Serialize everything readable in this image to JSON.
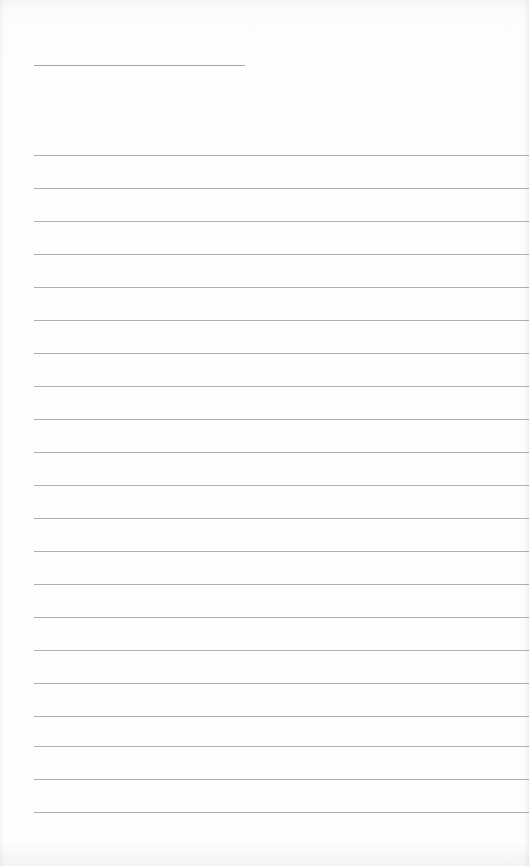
{
  "page": {
    "type": "lined-notebook-page",
    "background_color": "#fdfdfd",
    "line_color": "#8f8f8f"
  },
  "header": {
    "title_text": ""
  },
  "lines": [
    {
      "top": 155,
      "text": ""
    },
    {
      "top": 188,
      "text": ""
    },
    {
      "top": 221,
      "text": ""
    },
    {
      "top": 254,
      "text": ""
    },
    {
      "top": 287,
      "text": ""
    },
    {
      "top": 320,
      "text": ""
    },
    {
      "top": 353,
      "text": ""
    },
    {
      "top": 386,
      "text": ""
    },
    {
      "top": 419,
      "text": ""
    },
    {
      "top": 452,
      "text": ""
    },
    {
      "top": 485,
      "text": ""
    },
    {
      "top": 518,
      "text": ""
    },
    {
      "top": 551,
      "text": ""
    },
    {
      "top": 584,
      "text": ""
    },
    {
      "top": 617,
      "text": ""
    },
    {
      "top": 650,
      "text": ""
    },
    {
      "top": 683,
      "text": ""
    },
    {
      "top": 716,
      "text": ""
    },
    {
      "top": 746,
      "text": ""
    },
    {
      "top": 779,
      "text": ""
    },
    {
      "top": 812,
      "text": ""
    }
  ]
}
